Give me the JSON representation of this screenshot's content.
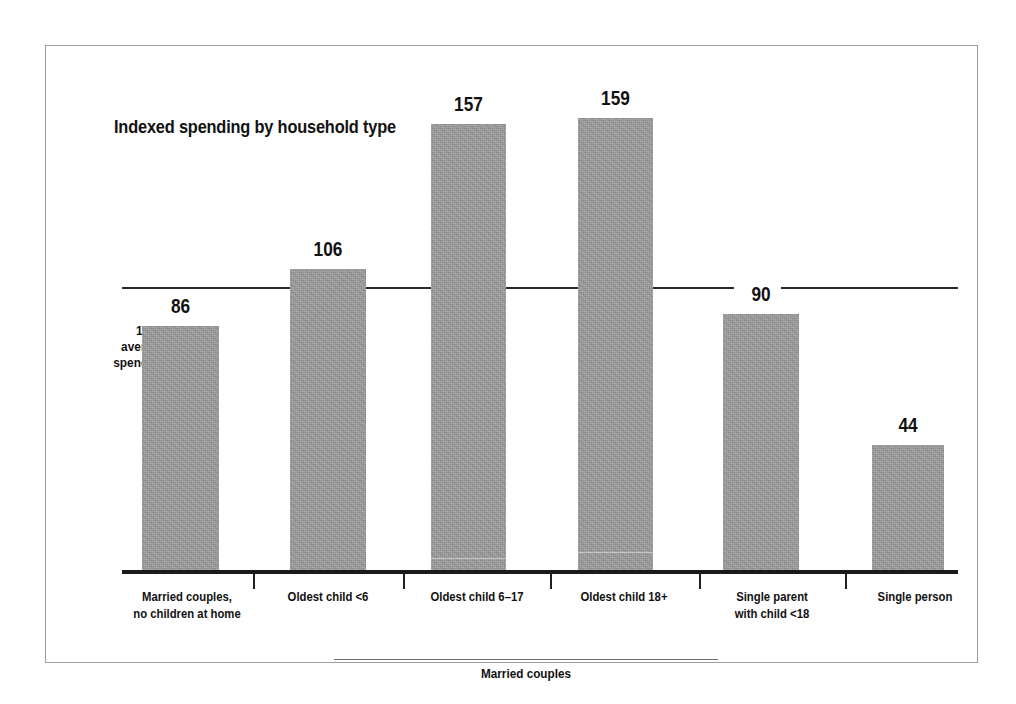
{
  "chart_data": {
    "type": "bar",
    "title": "Indexed spending by household type",
    "xlabel": "",
    "ylabel": "100 = average spending",
    "categories": [
      "Married couples,\nno children at home",
      "Oldest child <6",
      "Oldest child 6–17",
      "Oldest child 18+",
      "Single parent\nwith child <18",
      "Single person"
    ],
    "values": [
      86,
      106,
      157,
      159,
      90,
      44
    ],
    "reference_line": 100,
    "reference_line_label": "100 = average spending",
    "ylim": [
      0,
      170
    ],
    "grid": false,
    "legend": "none",
    "group_brackets": [
      {
        "label": "Married couples",
        "categories": [
          1,
          2,
          3
        ]
      }
    ],
    "bar_color": "#9c9c9c",
    "axis_color": "#1a1a1a",
    "text_color": "#111111"
  },
  "chart": {
    "title": "Indexed spending by household type",
    "y_axis_note": {
      "line1": "100 =",
      "line2": "average",
      "line3": "spending"
    },
    "bars": [
      {
        "label": "Married couples,",
        "label2": "no children at home",
        "value": "86",
        "value_num": 86
      },
      {
        "label": "Oldest child <6",
        "label2": "",
        "value": "106",
        "value_num": 106
      },
      {
        "label": "Oldest child 6–17",
        "label2": "",
        "value": "157",
        "value_num": 157
      },
      {
        "label": "Oldest child 18+",
        "label2": "",
        "value": "159",
        "value_num": 159
      },
      {
        "label": "Single parent",
        "label2": "with child <18",
        "value": "90",
        "value_num": 90
      },
      {
        "label": "Single person",
        "label2": "",
        "value": "44",
        "value_num": 44
      }
    ],
    "group_bracket_label": "Married couples"
  }
}
